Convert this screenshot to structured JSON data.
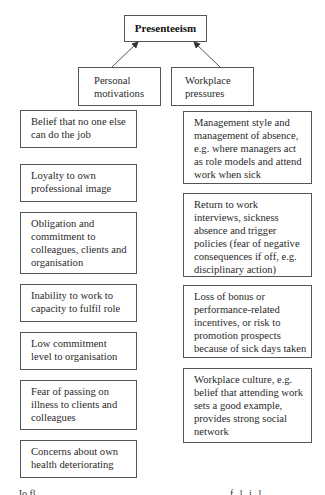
{
  "diagram": {
    "root": {
      "label": "Presenteeism"
    },
    "categories": [
      {
        "id": "personal",
        "label_lines": [
          "Personal",
          "motivations"
        ]
      },
      {
        "id": "workplace",
        "label_lines": [
          "Workplace",
          "pressures"
        ]
      }
    ],
    "personal_motivations": [
      {
        "lines": [
          "Belief that no one else",
          "can do the job"
        ]
      },
      {
        "lines": [
          "Loyalty to own",
          "professional image"
        ]
      },
      {
        "lines": [
          "Obligation and",
          "commitment to",
          "colleagues, clients and",
          "organisation"
        ]
      },
      {
        "lines": [
          "Inability to work to",
          "capacity to fulfil role"
        ]
      },
      {
        "lines": [
          "Low commitment",
          "level to organisation"
        ]
      },
      {
        "lines": [
          "Fear of passing on",
          "illness to  clients and",
          "colleagues"
        ]
      },
      {
        "lines": [
          "Concerns about own",
          "health deteriorating"
        ]
      }
    ],
    "workplace_pressures": [
      {
        "lines": [
          "Management style and",
          "management of absence,",
          "e.g. where managers act",
          "as role models and attend",
          "work when sick"
        ]
      },
      {
        "lines": [
          "Return to work",
          "interviews, sickness",
          "absence and trigger",
          "policies (fear of negative",
          "consequences if off, e.g.",
          "disciplinary action)"
        ]
      },
      {
        "lines": [
          "Loss of bonus or",
          "performance-related",
          "incentives, or risk to",
          "promotion prospects",
          "because of sick days taken"
        ]
      },
      {
        "lines": [
          "Workplace culture, e.g.",
          "belief that attending work",
          "sets a good example,",
          "provides strong social",
          "network"
        ]
      }
    ],
    "edges": [
      {
        "from": "personal",
        "to": "root",
        "type": "arrow"
      },
      {
        "from": "workplace",
        "to": "root",
        "type": "arrow"
      }
    ],
    "colors": {
      "border": "#555555",
      "text": "#2a2a2a",
      "arrow": "#444444"
    }
  },
  "footer_cutoff": {
    "left": "Jo  fl",
    "right": "f     l  i  l"
  }
}
